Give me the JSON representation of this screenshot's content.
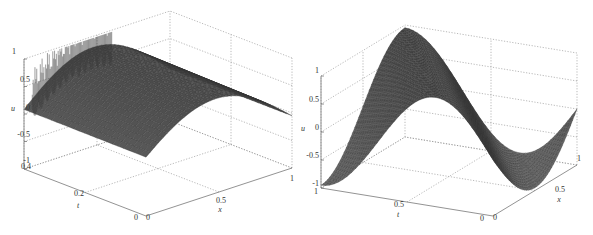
{
  "figure": {
    "background": "#ffffff",
    "surface_color": "#5a5a5a",
    "mesh_color": "#2e2e2e",
    "grid_color": "#8a8a8a",
    "axis_color": "#777777"
  },
  "chart_data": [
    {
      "type": "surface",
      "title": "",
      "xlabel": "x",
      "ylabel": "t",
      "zlabel": "u",
      "xlim": [
        0,
        1
      ],
      "ylim": [
        0,
        0.4
      ],
      "zlim": [
        -1,
        1
      ],
      "xticks": [
        "0",
        "0.5",
        "1"
      ],
      "yticks": [
        "0",
        "0.2",
        "0.4"
      ],
      "zticks": [
        "-1",
        "-0.5",
        "0",
        "0.5",
        "1"
      ],
      "grid": true,
      "description": "Mesh surface u(x,t): arched profile in x (approx. sin(pi*x) shape, peak ~0.9 near x=0.5), decaying slightly in t, with high-frequency spurious oscillation spikes along the far edge (t=0.4) reaching up to ~1.3.",
      "surface_samples": {
        "x": [
          0,
          0.25,
          0.5,
          0.75,
          1
        ],
        "t": [
          0,
          0.2,
          0.4
        ],
        "u": [
          [
            0.0,
            0.55,
            0.78,
            0.55,
            0.0
          ],
          [
            0.0,
            0.6,
            0.85,
            0.6,
            0.0
          ],
          [
            0.0,
            0.62,
            0.88,
            0.62,
            0.0
          ]
        ]
      },
      "has_oscillation_spikes": true
    },
    {
      "type": "surface",
      "title": "",
      "xlabel": "x",
      "ylabel": "t",
      "zlabel": "u",
      "xlim": [
        0,
        1
      ],
      "ylim": [
        0,
        1
      ],
      "zlim": [
        -1,
        1
      ],
      "xticks": [
        "0",
        "0.5",
        "1"
      ],
      "yticks": [
        "0",
        "0.5",
        "1"
      ],
      "zticks": [
        "-1",
        "-0.5",
        "0",
        "0.5",
        "1"
      ],
      "grid": true,
      "description": "Mesh surface u(x,t): traveling sine wave, u = sin(2*pi*(x - t)) style; amplitude 1, shifting phase with t.",
      "surface_samples": {
        "x": [
          0,
          0.25,
          0.5,
          0.75,
          1
        ],
        "t": [
          0,
          0.5,
          1
        ],
        "u": [
          [
            0.0,
            1.0,
            0.0,
            -1.0,
            0.0
          ],
          [
            0.0,
            -1.0,
            0.0,
            1.0,
            0.0
          ],
          [
            0.0,
            1.0,
            0.0,
            -1.0,
            0.0
          ]
        ]
      },
      "has_oscillation_spikes": false
    }
  ],
  "panels": {
    "left": {
      "zlabel": "u",
      "ylabel": "t",
      "xlabel": "x",
      "zticks": [
        "1",
        "0.5",
        "0",
        "-0.5",
        "-1"
      ],
      "yticks": [
        "0.4",
        "0.2",
        "0"
      ],
      "xticks": [
        "0",
        "0.5",
        "1"
      ]
    },
    "right": {
      "zlabel": "u",
      "ylabel": "t",
      "xlabel": "x",
      "zticks": [
        "1",
        "0.5",
        "0",
        "-0.5",
        "-1"
      ],
      "yticks": [
        "1",
        "0.5",
        "0"
      ],
      "xticks": [
        "0",
        "0.5",
        "1"
      ]
    }
  }
}
